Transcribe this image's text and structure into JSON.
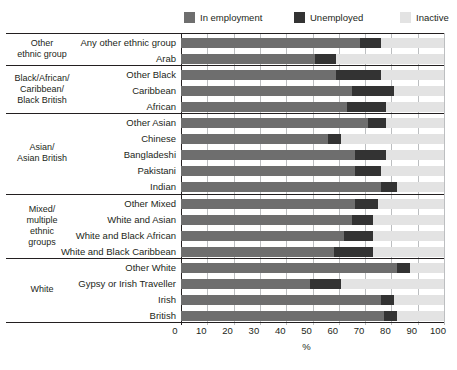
{
  "legend": {
    "items": [
      {
        "label": "In employment",
        "color": "#6e6e6e",
        "icon": "legend-swatch-employment"
      },
      {
        "label": "Unemployed",
        "color": "#333333",
        "icon": "legend-swatch-unemployed"
      },
      {
        "label": "Inactive",
        "color": "#e3e3e3",
        "icon": "legend-swatch-inactive"
      }
    ]
  },
  "axis": {
    "title": "%",
    "ticks": [
      "0",
      "10",
      "20",
      "30",
      "40",
      "50",
      "60",
      "70",
      "80",
      "90",
      "100"
    ]
  },
  "groups": [
    {
      "name": "Other\nethnic group",
      "label": "Other ethnic group",
      "rows": 2
    },
    {
      "name": "Black/African/\nCaribbean/\nBlack British",
      "label": "Black/African/Caribbean/Black British",
      "rows": 3
    },
    {
      "name": "Asian/\nAsian British",
      "label": "Asian/Asian British",
      "rows": 5
    },
    {
      "name": "Mixed/\nmultiple\nethnic\ngroups",
      "label": "Mixed/multiple ethnic groups",
      "rows": 4
    },
    {
      "name": "White",
      "label": "White",
      "rows": 4
    }
  ],
  "chart_data": {
    "type": "bar",
    "orientation": "horizontal",
    "stacked": true,
    "title": "",
    "xlabel": "%",
    "ylabel": "",
    "xlim": [
      0,
      100
    ],
    "grid": true,
    "legend_position": "top-right",
    "series": [
      {
        "name": "In employment",
        "color": "#6e6e6e"
      },
      {
        "name": "Unemployed",
        "color": "#333333"
      },
      {
        "name": "Inactive",
        "color": "#e3e3e3"
      }
    ],
    "categories": [
      "Any other ethnic group",
      "Arab",
      "Other Black",
      "Caribbean",
      "African",
      "Other Asian",
      "Chinese",
      "Bangladeshi",
      "Pakistani",
      "Indian",
      "Other Mixed",
      "White and Asian",
      "White and Black African",
      "White and Black Caribbean",
      "Other White",
      "Gypsy or Irish Traveller",
      "Irish",
      "British"
    ],
    "values": {
      "In employment": [
        68,
        51,
        59,
        65,
        63,
        71,
        56,
        66,
        66,
        76,
        66,
        65,
        62,
        58,
        82,
        49,
        76,
        77
      ],
      "Unemployed": [
        8,
        8,
        17,
        16,
        15,
        7,
        5,
        12,
        10,
        6,
        9,
        8,
        11,
        15,
        5,
        12,
        5,
        5
      ],
      "Inactive": [
        24,
        41,
        24,
        19,
        22,
        22,
        39,
        22,
        24,
        18,
        25,
        27,
        27,
        27,
        13,
        39,
        19,
        18
      ]
    }
  }
}
